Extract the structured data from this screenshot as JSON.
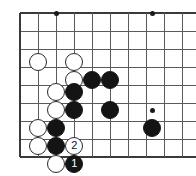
{
  "figure": {
    "board_style": "grid-with-star-points",
    "line_color": "#5a5a5a",
    "edge_color": "#3a3a3a",
    "background_color": "#ffffff",
    "black_stone_color": "#141414",
    "white_stone_color": "#ffffff"
  },
  "board": {
    "origin_x": 20,
    "origin_y": 13,
    "spacing": 18,
    "cols": 10,
    "rows": 9,
    "edges": {
      "top": true,
      "left": true,
      "bottom": true,
      "right": false
    }
  },
  "star_points": [
    {
      "x": 56,
      "y": 13
    },
    {
      "x": 152,
      "y": 13
    },
    {
      "x": 152,
      "y": 110
    }
  ],
  "stones": [
    {
      "color": "white",
      "x": 38,
      "y": 62,
      "label": ""
    },
    {
      "color": "white",
      "x": 74,
      "y": 62,
      "label": ""
    },
    {
      "color": "white",
      "x": 74,
      "y": 80,
      "label": ""
    },
    {
      "color": "black",
      "x": 92,
      "y": 80,
      "label": ""
    },
    {
      "color": "black",
      "x": 110,
      "y": 80,
      "label": ""
    },
    {
      "color": "white",
      "x": 56,
      "y": 92,
      "label": ""
    },
    {
      "color": "black",
      "x": 74,
      "y": 92,
      "label": ""
    },
    {
      "color": "white",
      "x": 56,
      "y": 110,
      "label": ""
    },
    {
      "color": "black",
      "x": 74,
      "y": 110,
      "label": ""
    },
    {
      "color": "black",
      "x": 110,
      "y": 110,
      "label": ""
    },
    {
      "color": "black",
      "x": 152,
      "y": 128,
      "label": ""
    },
    {
      "color": "white",
      "x": 38,
      "y": 128,
      "label": ""
    },
    {
      "color": "black",
      "x": 56,
      "y": 128,
      "label": ""
    },
    {
      "color": "white",
      "x": 38,
      "y": 146,
      "label": ""
    },
    {
      "color": "black",
      "x": 56,
      "y": 146,
      "label": ""
    },
    {
      "color": "white",
      "x": 74,
      "y": 146,
      "label": "2"
    },
    {
      "color": "white",
      "x": 56,
      "y": 164,
      "label": ""
    },
    {
      "color": "black",
      "x": 74,
      "y": 164,
      "label": "1"
    }
  ],
  "move_sequence": [
    {
      "number": "1",
      "color": "black"
    },
    {
      "number": "2",
      "color": "white"
    }
  ]
}
